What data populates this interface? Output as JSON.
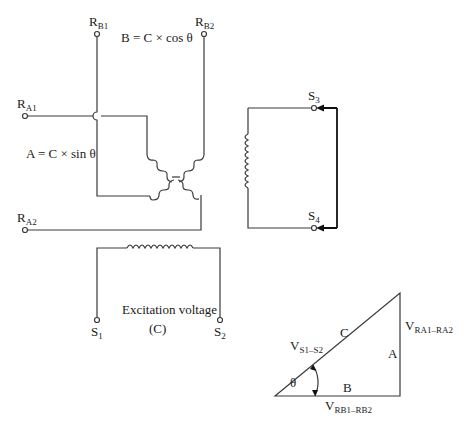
{
  "diagram": {
    "terminals": {
      "rb1": {
        "main": "R",
        "sub": "B1"
      },
      "rb2": {
        "main": "R",
        "sub": "B2"
      },
      "ra1": {
        "main": "R",
        "sub": "A1"
      },
      "ra2": {
        "main": "R",
        "sub": "A2"
      },
      "s3": {
        "main": "S",
        "sub": "3"
      },
      "s4": {
        "main": "S",
        "sub": "4"
      },
      "s1": {
        "main": "S",
        "sub": "1"
      },
      "s2": {
        "main": "S",
        "sub": "2"
      }
    },
    "equations": {
      "b": "B = C × cos θ",
      "a": "A = C × sin θ"
    },
    "excitation": {
      "line1": "Excitation voltage",
      "line2": "(C)"
    },
    "triangle": {
      "hyp_label": "C",
      "vertical_label": "A",
      "base_label": "B",
      "angle_label": "θ",
      "hyp_voltage": {
        "main": "V",
        "sub": "S1–S2"
      },
      "vertical_voltage": {
        "main": "V",
        "sub": "RA1–RA2"
      },
      "base_voltage": {
        "main": "V",
        "sub": "RB1–RB2"
      }
    }
  }
}
